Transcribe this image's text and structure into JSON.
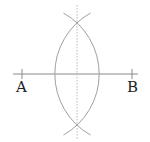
{
  "diagram": {
    "type": "perpendicular-bisector-construction",
    "points": [
      {
        "label": "A",
        "x": 22,
        "y": 74
      },
      {
        "label": "B",
        "x": 132,
        "y": 74
      }
    ],
    "segment_line": {
      "x1": 13,
      "y1": 74,
      "x2": 138,
      "y2": 74
    },
    "arc_radius": 70,
    "intersections": [
      {
        "x": 77,
        "y": 31
      },
      {
        "x": 77,
        "y": 117
      }
    ],
    "bisector": {
      "x": 77,
      "y1": 5,
      "y2": 140,
      "style": "dotted"
    },
    "colors": {
      "line": "#8a8a8a",
      "arc": "#a0a0a0",
      "bisector": "#b8b8b8",
      "label": "#222222"
    }
  }
}
